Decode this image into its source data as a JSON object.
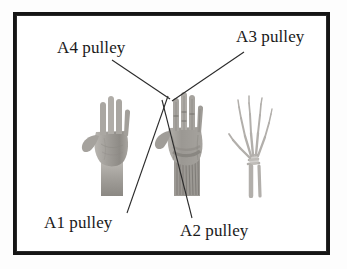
{
  "figure": {
    "frame": {
      "border_color": "#151515",
      "background": "#ffffff"
    },
    "background_color": "#fdfdfd",
    "text_color": "#1a1a1a"
  },
  "labels": [
    {
      "id": "a4",
      "text": "A4 pulley",
      "anchor": {
        "x": 57,
        "y": 38
      },
      "leader": {
        "x1": 112,
        "y1": 60,
        "x2": 170,
        "y2": 99
      }
    },
    {
      "id": "a3",
      "text": "A3 pulley",
      "anchor": {
        "x": 236,
        "y": 27
      },
      "leader": {
        "x1": 244,
        "y1": 52,
        "x2": 172,
        "y2": 101
      }
    },
    {
      "id": "a1",
      "text": "A1 pulley",
      "anchor": {
        "x": 44,
        "y": 213
      },
      "leader": {
        "x1": 127,
        "y1": 213,
        "x2": 168,
        "y2": 96
      }
    },
    {
      "id": "a2",
      "text": "A2 pulley",
      "anchor": {
        "x": 180,
        "y": 221
      },
      "leader": {
        "x1": 192,
        "y1": 218,
        "x2": 162,
        "y2": 100
      }
    }
  ],
  "panels": [
    {
      "id": "hand-photo",
      "caption": "",
      "icon": "hand-photograph",
      "description": "Grayscale photograph of a right hand, palm facing forward, fingers spread",
      "tone": "#9a9894"
    },
    {
      "id": "hand-anatomy",
      "caption": "",
      "icon": "hand-anatomy-dissection",
      "description": "Anatomical dissection of the hand showing flexor tendons and annular pulleys at the wrist",
      "tone": "#8f8d88"
    },
    {
      "id": "hand-xray",
      "caption": "",
      "icon": "hand-xray-skeleton",
      "description": "Radiograph of the hand skeleton showing phalanges, metacarpals and carpal bones",
      "tone": "#b9b7b3"
    }
  ]
}
